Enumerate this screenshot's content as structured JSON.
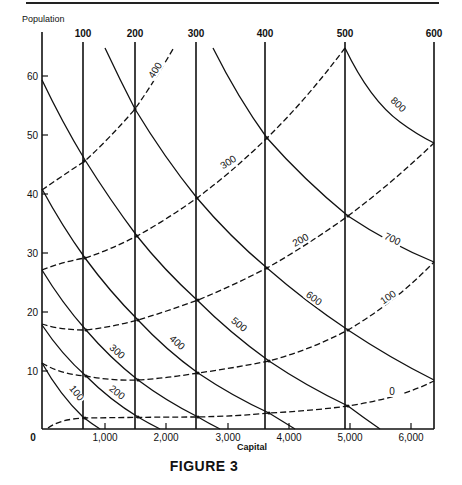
{
  "page": {
    "header_rule": true,
    "figure_caption": "FIGURE 3"
  },
  "chart_data": {
    "type": "line",
    "title": "FIGURE 3",
    "xlabel": "Capital",
    "ylabel": "Population",
    "xlim": [
      0,
      6400
    ],
    "ylim": [
      0,
      65
    ],
    "grid": false,
    "x_ticks": [
      "0",
      "1,000",
      "2,000",
      "3,000",
      "4,000",
      "5,000",
      "6,000"
    ],
    "y_ticks": [
      "10",
      "20",
      "30",
      "40",
      "50",
      "60"
    ],
    "families": [
      {
        "name": "vertical lines (top labels)",
        "style": "solid",
        "labels": [
          "100",
          "200",
          "300",
          "400",
          "500",
          "600"
        ],
        "x_capital": [
          670,
          1510,
          2500,
          3630,
          4930,
          6370
        ]
      },
      {
        "name": "descending solid curves",
        "style": "solid",
        "series": [
          {
            "name": "100",
            "points": [
              [
                0,
                11
              ],
              [
                700,
                2
              ],
              [
                950,
                0
              ]
            ]
          },
          {
            "name": "200",
            "points": [
              [
                0,
                18
              ],
              [
                730,
                9
              ],
              [
                1560,
                2
              ],
              [
                1920,
                0
              ]
            ]
          },
          {
            "name": "300",
            "points": [
              [
                0,
                27
              ],
              [
                730,
                17
              ],
              [
                1560,
                8.5
              ],
              [
                2540,
                2
              ],
              [
                2900,
                0
              ]
            ]
          },
          {
            "name": "400",
            "points": [
              [
                0,
                41
              ],
              [
                700,
                29
              ],
              [
                1560,
                18.5
              ],
              [
                2540,
                9.5
              ],
              [
                3690,
                2.7
              ],
              [
                4110,
                0
              ]
            ]
          },
          {
            "name": "500",
            "points": [
              [
                0,
                59
              ],
              [
                700,
                45.5
              ],
              [
                1540,
                33
              ],
              [
                2540,
                21.5
              ],
              [
                3690,
                11.5
              ],
              [
                4980,
                3.9
              ],
              [
                5500,
                0
              ]
            ]
          },
          {
            "name": "600",
            "points": [
              [
                1030,
                64
              ],
              [
                1510,
                54.5
              ],
              [
                2520,
                39.2
              ],
              [
                3650,
                27.5
              ],
              [
                4980,
                16.9
              ],
              [
                6370,
                8.3
              ]
            ]
          },
          {
            "name": "700",
            "points": [
              [
                2780,
                64
              ],
              [
                3650,
                49.5
              ],
              [
                4980,
                36.3
              ],
              [
                6370,
                28.3
              ]
            ]
          },
          {
            "name": "800",
            "points": [
              [
                4930,
                65
              ],
              [
                6370,
                48.5
              ]
            ]
          }
        ]
      },
      {
        "name": "ascending dashed curves",
        "style": "dashed",
        "series": [
          {
            "name": "0",
            "points": [
              [
                100,
                0.2
              ],
              [
                730,
                1.9
              ],
              [
                1560,
                2.0
              ],
              [
                2540,
                2.0
              ],
              [
                3690,
                2.7
              ],
              [
                4980,
                3.9
              ],
              [
                6370,
                8.0
              ]
            ]
          },
          {
            "name": "100",
            "points": [
              [
                0,
                11
              ],
              [
                730,
                9
              ],
              [
                1560,
                8.5
              ],
              [
                2540,
                9.5
              ],
              [
                3690,
                11.5
              ],
              [
                4980,
                16.9
              ],
              [
                6370,
                28.3
              ]
            ]
          },
          {
            "name": "200",
            "points": [
              [
                0,
                18
              ],
              [
                730,
                17
              ],
              [
                1560,
                18.5
              ],
              [
                2540,
                21.5
              ],
              [
                3650,
                27.5
              ],
              [
                4980,
                36.3
              ],
              [
                6370,
                48.5
              ]
            ]
          },
          {
            "name": "300",
            "points": [
              [
                0,
                27
              ],
              [
                700,
                29
              ],
              [
                1540,
                33
              ],
              [
                2520,
                39.2
              ],
              [
                3650,
                49.5
              ],
              [
                4930,
                65
              ]
            ]
          },
          {
            "name": "400",
            "points": [
              [
                0,
                41
              ],
              [
                700,
                45.5
              ],
              [
                1510,
                54.5
              ],
              [
                2130,
                64
              ]
            ]
          }
        ]
      }
    ],
    "annotations": {
      "top_labels": [
        "100",
        "200",
        "300",
        "400",
        "500",
        "600"
      ],
      "solid_curve_labels": [
        "100",
        "200",
        "300",
        "400",
        "500",
        "600",
        "700",
        "800"
      ],
      "dashed_curve_labels": [
        "0",
        "100",
        "200",
        "300",
        "400"
      ]
    }
  },
  "labels": {
    "y_axis_title": "Population",
    "x_axis_title": "Capital",
    "origin": "0",
    "y_ticks": [
      {
        "label": "60",
        "y": 76
      },
      {
        "label": "50",
        "y": 135
      },
      {
        "label": "40",
        "y": 194
      },
      {
        "label": "30",
        "y": 253
      },
      {
        "label": "20",
        "y": 312
      },
      {
        "label": "10",
        "y": 371
      }
    ],
    "x_ticks": [
      {
        "label": "1,000",
        "x": 105
      },
      {
        "label": "2,000",
        "x": 166
      },
      {
        "label": "3,000",
        "x": 228
      },
      {
        "label": "4,000",
        "x": 289
      },
      {
        "label": "5,000",
        "x": 350
      },
      {
        "label": "6,000",
        "x": 411
      }
    ],
    "top": [
      {
        "label": "100",
        "x": 83
      },
      {
        "label": "200",
        "x": 135
      },
      {
        "label": "300",
        "x": 196
      },
      {
        "label": "400",
        "x": 265
      },
      {
        "label": "500",
        "x": 345
      },
      {
        "label": "600",
        "x": 434
      }
    ],
    "solid_curves": [
      {
        "label": "100",
        "x": 74,
        "y": 395,
        "rot": 52
      },
      {
        "label": "200",
        "x": 115,
        "y": 395,
        "rot": 38
      },
      {
        "label": "300",
        "x": 115,
        "y": 354,
        "rot": 42
      },
      {
        "label": "400",
        "x": 175,
        "y": 345,
        "rot": 42
      },
      {
        "label": "500",
        "x": 237,
        "y": 327,
        "rot": 40
      },
      {
        "label": "600",
        "x": 312,
        "y": 301,
        "rot": 36
      },
      {
        "label": "700",
        "x": 391,
        "y": 242,
        "rot": 25
      },
      {
        "label": "800",
        "x": 396,
        "y": 107,
        "rot": 43
      }
    ],
    "dashed_curves": [
      {
        "label": "0",
        "x": 392,
        "y": 395,
        "rot": 0
      },
      {
        "label": "100",
        "x": 390,
        "y": 300,
        "rot": -35
      },
      {
        "label": "200",
        "x": 302,
        "y": 243,
        "rot": -28
      },
      {
        "label": "300",
        "x": 230,
        "y": 165,
        "rot": -32
      },
      {
        "label": "400",
        "x": 158,
        "y": 72,
        "rot": -58
      }
    ]
  }
}
